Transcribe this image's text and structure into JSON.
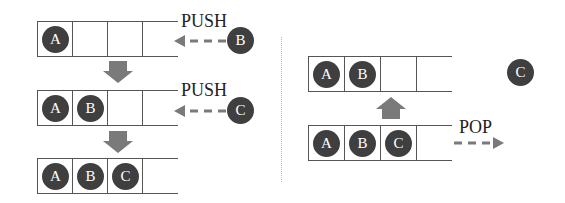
{
  "colors": {
    "ball": "#3f3f3f",
    "arrow": "#7a7a7a",
    "line": "#555555"
  },
  "push_section": {
    "steps": [
      {
        "cells": [
          "A",
          "",
          "",
          ""
        ],
        "operation": "PUSH",
        "incoming": "B"
      },
      {
        "cells": [
          "A",
          "B",
          "",
          ""
        ],
        "operation": "PUSH",
        "incoming": "C"
      },
      {
        "cells": [
          "A",
          "B",
          "C",
          ""
        ]
      }
    ]
  },
  "pop_section": {
    "before": {
      "cells": [
        "A",
        "B",
        "C",
        ""
      ],
      "operation": "POP"
    },
    "after": {
      "cells": [
        "A",
        "B",
        "",
        ""
      ]
    },
    "popped": "C"
  }
}
